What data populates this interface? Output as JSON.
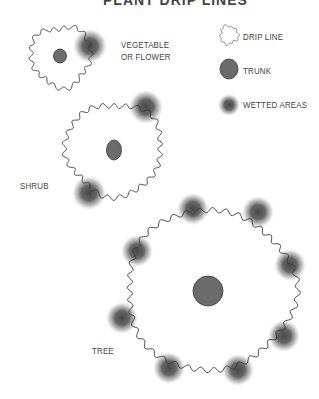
{
  "title": "PLANT DRIP LINES",
  "legend": {
    "items": [
      {
        "icon": "drip-line-icon",
        "label": "DRIP LINE"
      },
      {
        "icon": "trunk-icon",
        "label": "TRUNK"
      },
      {
        "icon": "wetted-area-icon",
        "label": "WETTED AREAS"
      }
    ]
  },
  "plants": [
    {
      "name": "vegetable",
      "label_line1": "VEGETABLE",
      "label_line2": "OR FLOWER"
    },
    {
      "name": "shrub",
      "label": "SHRUB"
    },
    {
      "name": "tree",
      "label": "TREE"
    }
  ],
  "colors": {
    "trunk": "#6b6b6b",
    "outline": "#3a3a3a",
    "wetted": "#4a4a4a",
    "text": "#444444"
  }
}
